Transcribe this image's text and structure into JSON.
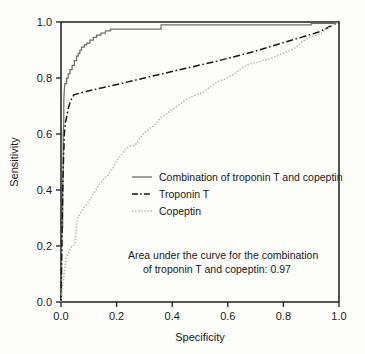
{
  "chart_data": {
    "type": "line",
    "title": "",
    "xlabel": "Specificity",
    "ylabel": "Sensitivity",
    "xlim": [
      0.0,
      1.0
    ],
    "ylim": [
      0.0,
      1.0
    ],
    "xticks": [
      "0.0",
      "0.2",
      "0.4",
      "0.6",
      "0.8",
      "1.0"
    ],
    "yticks": [
      "0.0",
      "0.2",
      "0.4",
      "0.6",
      "0.8",
      "1.0"
    ],
    "xtick_values": [
      0.0,
      0.2,
      0.4,
      0.6,
      0.8,
      1.0
    ],
    "ytick_values": [
      0.0,
      0.2,
      0.4,
      0.6,
      0.8,
      1.0
    ],
    "grid": false,
    "legend_position": "center",
    "annotation": {
      "line1": "Area under the curve for the combination",
      "line2": "of troponin T and copeptin: 0.97",
      "auc_value": "0.97"
    },
    "series": [
      {
        "name": "Combination of troponin T and copeptin",
        "style": "solid",
        "color": "#6e6e6e",
        "points": [
          [
            0.0,
            0.0
          ],
          [
            0.002,
            0.09
          ],
          [
            0.002,
            0.185
          ],
          [
            0.004,
            0.265
          ],
          [
            0.006,
            0.265
          ],
          [
            0.006,
            0.4
          ],
          [
            0.008,
            0.48
          ],
          [
            0.008,
            0.6
          ],
          [
            0.01,
            0.64
          ],
          [
            0.01,
            0.72
          ],
          [
            0.012,
            0.76
          ],
          [
            0.014,
            0.78
          ],
          [
            0.02,
            0.78
          ],
          [
            0.02,
            0.8
          ],
          [
            0.026,
            0.8
          ],
          [
            0.026,
            0.815
          ],
          [
            0.032,
            0.815
          ],
          [
            0.032,
            0.83
          ],
          [
            0.04,
            0.83
          ],
          [
            0.04,
            0.845
          ],
          [
            0.048,
            0.845
          ],
          [
            0.048,
            0.862
          ],
          [
            0.056,
            0.862
          ],
          [
            0.056,
            0.878
          ],
          [
            0.062,
            0.878
          ],
          [
            0.062,
            0.888
          ],
          [
            0.068,
            0.888
          ],
          [
            0.068,
            0.9
          ],
          [
            0.074,
            0.9
          ],
          [
            0.074,
            0.91
          ],
          [
            0.084,
            0.91
          ],
          [
            0.084,
            0.918
          ],
          [
            0.092,
            0.918
          ],
          [
            0.092,
            0.925
          ],
          [
            0.104,
            0.925
          ],
          [
            0.104,
            0.935
          ],
          [
            0.116,
            0.935
          ],
          [
            0.116,
            0.945
          ],
          [
            0.128,
            0.945
          ],
          [
            0.128,
            0.953
          ],
          [
            0.144,
            0.953
          ],
          [
            0.144,
            0.96
          ],
          [
            0.16,
            0.96
          ],
          [
            0.16,
            0.968
          ],
          [
            0.178,
            0.968
          ],
          [
            0.178,
            0.975
          ],
          [
            0.36,
            0.975
          ],
          [
            0.36,
            0.99
          ],
          [
            0.9,
            0.99
          ],
          [
            0.9,
            0.995
          ],
          [
            0.98,
            0.995
          ],
          [
            1.0,
            1.0
          ]
        ]
      },
      {
        "name": "Troponin T",
        "style": "dashdot",
        "color": "#171717",
        "points": [
          [
            0.0,
            0.0
          ],
          [
            0.004,
            0.27
          ],
          [
            0.008,
            0.48
          ],
          [
            0.012,
            0.6
          ],
          [
            0.016,
            0.64
          ],
          [
            0.026,
            0.69
          ],
          [
            0.034,
            0.718
          ],
          [
            0.046,
            0.74
          ],
          [
            0.09,
            0.752
          ],
          [
            0.18,
            0.772
          ],
          [
            0.3,
            0.8
          ],
          [
            0.42,
            0.828
          ],
          [
            0.56,
            0.86
          ],
          [
            0.7,
            0.896
          ],
          [
            0.84,
            0.938
          ],
          [
            0.93,
            0.965
          ],
          [
            1.0,
            1.0
          ]
        ]
      },
      {
        "name": "Copeptin",
        "style": "dotted",
        "color": "#b4b4b4",
        "points": [
          [
            0.0,
            0.0
          ],
          [
            0.004,
            0.035
          ],
          [
            0.006,
            0.06
          ],
          [
            0.008,
            0.075
          ],
          [
            0.01,
            0.09
          ],
          [
            0.012,
            0.105
          ],
          [
            0.014,
            0.12
          ],
          [
            0.016,
            0.135
          ],
          [
            0.018,
            0.148
          ],
          [
            0.02,
            0.16
          ],
          [
            0.024,
            0.172
          ],
          [
            0.03,
            0.182
          ],
          [
            0.036,
            0.196
          ],
          [
            0.044,
            0.2
          ],
          [
            0.05,
            0.208
          ],
          [
            0.052,
            0.225
          ],
          [
            0.054,
            0.25
          ],
          [
            0.056,
            0.27
          ],
          [
            0.058,
            0.29
          ],
          [
            0.062,
            0.305
          ],
          [
            0.07,
            0.318
          ],
          [
            0.078,
            0.33
          ],
          [
            0.086,
            0.342
          ],
          [
            0.096,
            0.352
          ],
          [
            0.104,
            0.368
          ],
          [
            0.112,
            0.38
          ],
          [
            0.12,
            0.392
          ],
          [
            0.128,
            0.404
          ],
          [
            0.136,
            0.418
          ],
          [
            0.146,
            0.43
          ],
          [
            0.156,
            0.442
          ],
          [
            0.168,
            0.452
          ],
          [
            0.178,
            0.468
          ],
          [
            0.188,
            0.48
          ],
          [
            0.196,
            0.495
          ],
          [
            0.204,
            0.51
          ],
          [
            0.214,
            0.522
          ],
          [
            0.224,
            0.535
          ],
          [
            0.234,
            0.548
          ],
          [
            0.248,
            0.556
          ],
          [
            0.266,
            0.56
          ],
          [
            0.276,
            0.572
          ],
          [
            0.286,
            0.588
          ],
          [
            0.296,
            0.6
          ],
          [
            0.308,
            0.612
          ],
          [
            0.322,
            0.622
          ],
          [
            0.336,
            0.632
          ],
          [
            0.348,
            0.645
          ],
          [
            0.36,
            0.66
          ],
          [
            0.374,
            0.668
          ],
          [
            0.388,
            0.678
          ],
          [
            0.402,
            0.688
          ],
          [
            0.418,
            0.7
          ],
          [
            0.434,
            0.71
          ],
          [
            0.448,
            0.722
          ],
          [
            0.462,
            0.73
          ],
          [
            0.476,
            0.735
          ],
          [
            0.492,
            0.742
          ],
          [
            0.51,
            0.748
          ],
          [
            0.526,
            0.76
          ],
          [
            0.542,
            0.772
          ],
          [
            0.556,
            0.782
          ],
          [
            0.572,
            0.79
          ],
          [
            0.588,
            0.796
          ],
          [
            0.604,
            0.804
          ],
          [
            0.62,
            0.812
          ],
          [
            0.636,
            0.824
          ],
          [
            0.652,
            0.836
          ],
          [
            0.668,
            0.846
          ],
          [
            0.686,
            0.852
          ],
          [
            0.706,
            0.856
          ],
          [
            0.726,
            0.862
          ],
          [
            0.748,
            0.868
          ],
          [
            0.768,
            0.876
          ],
          [
            0.788,
            0.884
          ],
          [
            0.808,
            0.892
          ],
          [
            0.828,
            0.9
          ],
          [
            0.848,
            0.912
          ],
          [
            0.866,
            0.928
          ],
          [
            0.884,
            0.94
          ],
          [
            0.9,
            0.948
          ],
          [
            0.918,
            0.952
          ],
          [
            0.936,
            0.96
          ],
          [
            0.952,
            0.972
          ],
          [
            0.968,
            0.982
          ],
          [
            0.984,
            0.992
          ],
          [
            1.0,
            1.0
          ]
        ]
      }
    ]
  },
  "legend": {
    "items": [
      {
        "label": "Combination of troponin T and copeptin",
        "style": "solid"
      },
      {
        "label": "Troponin T",
        "style": "dashdot"
      },
      {
        "label": "Copeptin",
        "style": "dotted"
      }
    ]
  },
  "colors": {
    "background": "#fdfdfb",
    "axis": "#2b2b2b",
    "combination": "#6e6e6e",
    "troponin": "#171717",
    "copeptin": "#b4b4b4",
    "text": "#1a1a1a"
  }
}
